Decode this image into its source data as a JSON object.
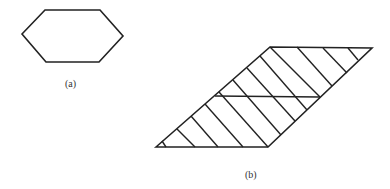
{
  "figures": [
    {
      "id": "a",
      "label": "(a)",
      "shape": "hexagon",
      "points": [
        [
          22,
          34
        ],
        [
          45,
          10
        ],
        [
          100,
          10
        ],
        [
          123,
          36
        ],
        [
          99,
          62
        ],
        [
          46,
          62
        ]
      ]
    },
    {
      "id": "b",
      "label": "(b)",
      "shape": "hatched-parallelogram",
      "outline": [
        [
          156,
          147
        ],
        [
          270,
          47
        ],
        [
          372,
          48
        ],
        [
          268,
          147
        ]
      ],
      "divider": [
        [
          215,
          96
        ],
        [
          320,
          97
        ]
      ],
      "hatch_lines": [
        [
          [
            162,
            141
          ],
          [
            166,
            147
          ]
        ],
        [
          [
            177,
            129
          ],
          [
            195,
            147
          ]
        ],
        [
          [
            191,
            116
          ],
          [
            218,
            147
          ]
        ],
        [
          [
            205,
            104
          ],
          [
            243,
            147
          ]
        ],
        [
          [
            219,
            92
          ],
          [
            268,
            147
          ]
        ],
        [
          [
            233,
            80
          ],
          [
            281,
            135
          ]
        ],
        [
          [
            247,
            68
          ],
          [
            295,
            121
          ]
        ],
        [
          [
            260,
            56
          ],
          [
            307,
            110
          ]
        ],
        [
          [
            270,
            47
          ],
          [
            320,
            97
          ]
        ],
        [
          [
            297,
            47
          ],
          [
            332,
            86
          ]
        ],
        [
          [
            323,
            48
          ],
          [
            347,
            73
          ]
        ],
        [
          [
            348,
            48
          ],
          [
            358,
            60
          ]
        ]
      ]
    }
  ]
}
